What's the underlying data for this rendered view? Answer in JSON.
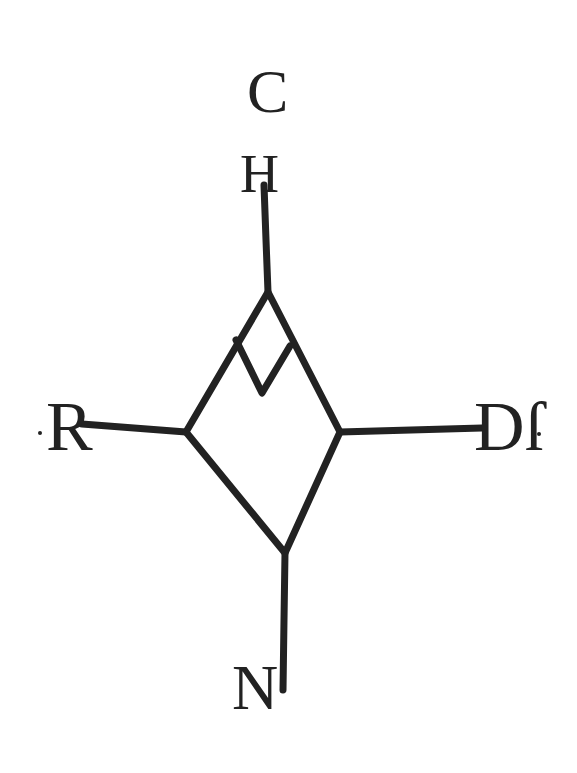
{
  "diagram": {
    "type": "emblem-diamond",
    "colors": {
      "background": "#ffffff",
      "ink": "#222222"
    },
    "labels": {
      "top_outer": "C",
      "top_inner": "H",
      "left": "R",
      "right": "Dſ",
      "bottom": "N"
    },
    "geometry": {
      "diamond": {
        "top": [
          268,
          292
        ],
        "left": [
          186,
          432
        ],
        "right": [
          340,
          432
        ],
        "bottom": [
          285,
          553
        ]
      },
      "inner_v": [
        [
          236,
          340
        ],
        [
          262,
          393
        ],
        [
          290,
          346
        ]
      ],
      "stems": {
        "top": [
          [
            264,
            185
          ],
          [
            268,
            292
          ]
        ],
        "left": [
          [
            82,
            424
          ],
          [
            186,
            432
          ]
        ],
        "right": [
          [
            340,
            432
          ],
          [
            482,
            428
          ]
        ],
        "bottom": [
          [
            285,
            553
          ],
          [
            283,
            690
          ]
        ]
      }
    }
  }
}
